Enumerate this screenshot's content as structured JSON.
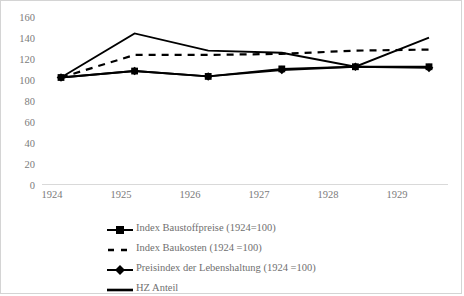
{
  "chart_data": {
    "type": "line",
    "title": "",
    "xlabel": "",
    "ylabel": "",
    "categories": [
      "1924",
      "1925",
      "1926",
      "1927",
      "1928",
      "1929"
    ],
    "ylim": [
      0,
      160
    ],
    "ytick_step": 20,
    "yticks": [
      "160",
      "140",
      "120",
      "100",
      "80",
      "60",
      "40",
      "20",
      "0"
    ],
    "grid": false,
    "legend_position": "bottom",
    "series": [
      {
        "name": "Index Baustoffpreise (1924=100)",
        "marker": "square",
        "style": "solid",
        "values": [
          100,
          106,
          101,
          108,
          110,
          110
        ]
      },
      {
        "name": "Index Baukosten (1924 =100)",
        "marker": "none",
        "style": "dashed",
        "values": [
          100,
          121,
          121,
          122,
          125,
          126
        ]
      },
      {
        "name": "Preisindex der Lebenshaltung (1924 =100)",
        "marker": "diamond",
        "style": "solid",
        "values": [
          100,
          106,
          101,
          107,
          110,
          109
        ]
      },
      {
        "name": "HZ Anteil",
        "marker": "none",
        "style": "solid",
        "values": [
          100,
          141,
          125,
          123,
          110,
          137
        ]
      }
    ]
  },
  "axis": {
    "y_labels": [
      "160",
      "140",
      "120",
      "100",
      "80",
      "60",
      "40",
      "20",
      "0"
    ],
    "x_labels": [
      "1924",
      "1925",
      "1926",
      "1927",
      "1928",
      "1929"
    ]
  },
  "legend": {
    "items": [
      {
        "label": "Index Baustoffpreise (1924=100)",
        "key": "square-marker-line"
      },
      {
        "label": "Index Baukosten (1924 =100)",
        "key": "dashed-line"
      },
      {
        "label": "Preisindex der Lebenshaltung (1924 =100)",
        "key": "diamond-marker-line"
      },
      {
        "label": "HZ Anteil",
        "key": "solid-line"
      }
    ]
  },
  "colors": {
    "series": "#000000",
    "axis": "#d9d9d9",
    "tick_text": "#7b7b7b",
    "frame": "#d4d4d4",
    "background": "#ffffff"
  }
}
